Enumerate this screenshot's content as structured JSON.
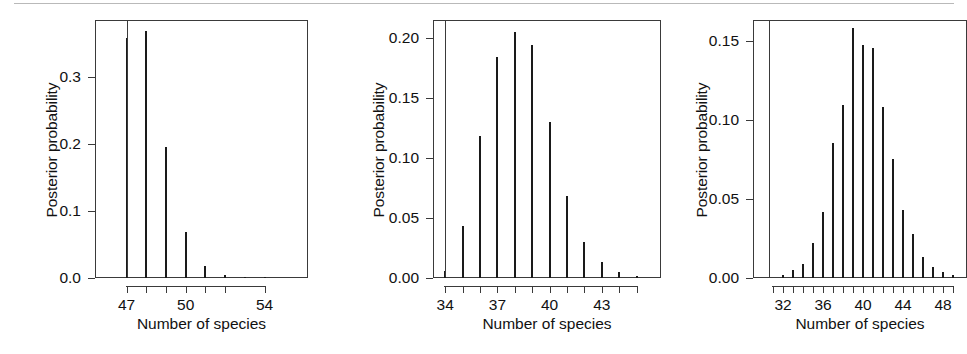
{
  "figure": {
    "panel_count": 3,
    "ink_color": "#1a1a1a",
    "axis_color": "#3a3a3a",
    "background": "#ffffff"
  },
  "chart_data": [
    {
      "type": "bar",
      "panel": "left",
      "title": "",
      "xlabel": "Number of species",
      "ylabel": "Posterior probability",
      "categories": [
        47,
        48,
        49,
        50,
        51,
        52,
        53,
        54
      ],
      "values": [
        0.358,
        0.368,
        0.195,
        0.069,
        0.018,
        0.004,
        0.0,
        0.002
      ],
      "xlim": [
        45.4,
        56.2
      ],
      "ylim": [
        0.0,
        0.385
      ],
      "ytick_values": [
        0.0,
        0.1,
        0.2,
        0.3
      ],
      "ytick_labels": [
        "0.0",
        "0.1",
        "0.2",
        "0.3"
      ],
      "xtick_values": [
        47,
        48,
        49,
        50,
        51,
        52,
        54
      ],
      "xtick_labels_shown": {
        "47": "47",
        "50": "50",
        "54": "54"
      },
      "reference_line_x": 47,
      "grid": false,
      "legend": "none"
    },
    {
      "type": "bar",
      "panel": "middle",
      "title": "",
      "xlabel": "Number of species",
      "ylabel": "Posterior probability",
      "categories": [
        34,
        35,
        36,
        37,
        38,
        39,
        40,
        41,
        42,
        43,
        44,
        45
      ],
      "values": [
        0.006,
        0.043,
        0.118,
        0.184,
        0.205,
        0.194,
        0.13,
        0.068,
        0.03,
        0.013,
        0.005,
        0.002
      ],
      "xlim": [
        33.3,
        46.4
      ],
      "ylim": [
        0.0,
        0.215
      ],
      "ytick_values": [
        0.0,
        0.05,
        0.1,
        0.15,
        0.2
      ],
      "ytick_labels": [
        "0.00",
        "0.05",
        "0.10",
        "0.15",
        "0.20"
      ],
      "xtick_values": [
        34,
        35,
        36,
        37,
        38,
        39,
        40,
        41,
        42,
        43,
        44,
        45
      ],
      "xtick_labels_shown": {
        "34": "34",
        "37": "37",
        "40": "40",
        "43": "43"
      },
      "reference_line_x": 34,
      "grid": false,
      "legend": "none"
    },
    {
      "type": "bar",
      "panel": "right",
      "title": "",
      "xlabel": "Number of species",
      "ylabel": "Posterior probability",
      "categories": [
        32,
        33,
        34,
        35,
        36,
        37,
        38,
        39,
        40,
        41,
        42,
        43,
        44,
        45,
        46,
        47,
        48,
        49
      ],
      "values": [
        0.002,
        0.005,
        0.009,
        0.022,
        0.042,
        0.085,
        0.109,
        0.158,
        0.147,
        0.145,
        0.108,
        0.075,
        0.043,
        0.028,
        0.013,
        0.007,
        0.004,
        0.002
      ],
      "xlim": [
        29.0,
        50.4
      ],
      "ylim": [
        0.0,
        0.163
      ],
      "ytick_values": [
        0.0,
        0.05,
        0.1,
        0.15
      ],
      "ytick_labels": [
        "0.00",
        "0.05",
        "0.10",
        "0.15"
      ],
      "xtick_values": [
        31,
        32,
        33,
        34,
        35,
        36,
        37,
        38,
        39,
        40,
        41,
        42,
        43,
        44,
        45,
        46,
        47,
        48,
        49
      ],
      "xtick_labels_shown": {
        "32": "32",
        "36": "36",
        "40": "40",
        "44": "44",
        "48": "48"
      },
      "reference_line_x": 30.6,
      "grid": false,
      "legend": "none"
    }
  ],
  "panels": [
    {
      "id": "panel-left",
      "ylabel": "Posterior probability",
      "xlabel": "Number of species",
      "ytick_labels": [
        "0.3",
        "0.2",
        "0.1",
        "0.0"
      ],
      "xtick_labels": [
        "47",
        "50",
        "54"
      ]
    },
    {
      "id": "panel-middle",
      "ylabel": "Posterior probability",
      "xlabel": "Number of species",
      "ytick_labels": [
        "0.20",
        "0.15",
        "0.10",
        "0.05",
        "0.00"
      ],
      "xtick_labels": [
        "34",
        "37",
        "40",
        "43"
      ]
    },
    {
      "id": "panel-right",
      "ylabel": "Posterior probability",
      "xlabel": "Number of species",
      "ytick_labels": [
        "0.15",
        "0.10",
        "0.05",
        "0.00"
      ],
      "xtick_labels": [
        "32",
        "36",
        "40",
        "44",
        "48"
      ]
    }
  ]
}
